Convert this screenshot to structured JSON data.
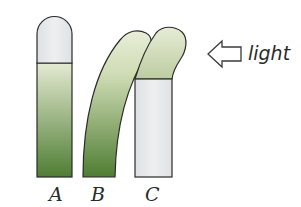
{
  "diagram": {
    "light_label": "light",
    "arrow_icon": "left-arrow-icon",
    "colors": {
      "cap": "#e6e7e9",
      "green_top": "#e4ead2",
      "green_bottom": "#4f7d33",
      "outline": "#2b2b2b",
      "sheath": "#e9eaec"
    },
    "specimens": [
      {
        "label": "A",
        "description": "straight coleoptile with covered tip"
      },
      {
        "label": "B",
        "description": "coleoptile bending toward light"
      },
      {
        "label": "C",
        "description": "covered base, exposed tip bending toward light"
      }
    ]
  }
}
